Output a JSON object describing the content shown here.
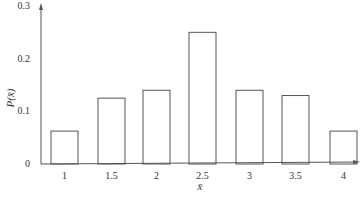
{
  "chart_data": {
    "type": "bar",
    "title": "",
    "xlabel": "x̄",
    "ylabel": "P(x̄)",
    "categories": [
      "1",
      "1.5",
      "2",
      "2.5",
      "3",
      "3.5",
      "4"
    ],
    "values": [
      0.0625,
      0.125,
      0.14,
      0.25,
      0.14,
      0.13,
      0.0625
    ],
    "ylim": [
      0,
      0.3
    ],
    "yticks": [
      "0",
      "0.1",
      "0.2",
      "0.3"
    ],
    "grid": false,
    "legend": null,
    "colors": {
      "bar_fill": "#ffffff",
      "bar_stroke": "#555555",
      "axis": "#555555"
    }
  }
}
